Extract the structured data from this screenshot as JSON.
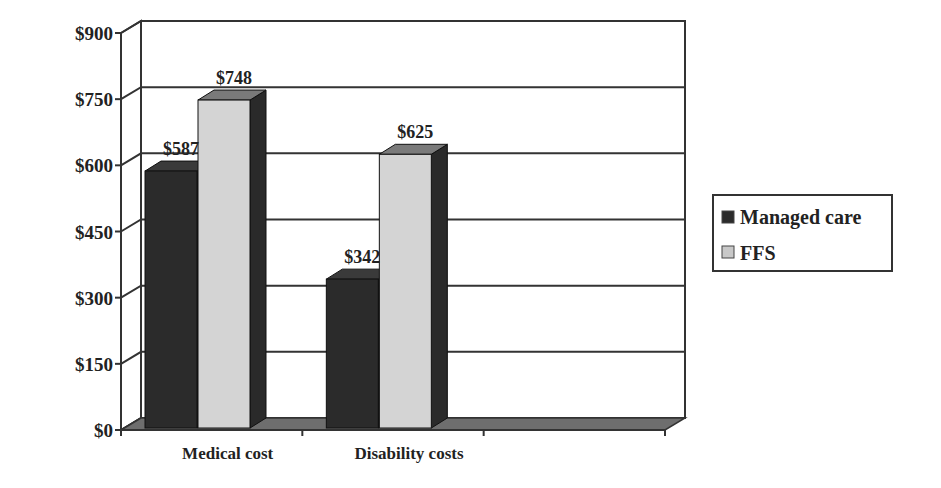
{
  "chart_data": {
    "type": "bar",
    "style": "3d-clustered-column",
    "title": "",
    "xlabel": "",
    "ylabel": "",
    "categories": [
      "Medical cost",
      "Disability costs"
    ],
    "series": [
      {
        "name": "Managed care",
        "values": [
          587,
          342
        ],
        "labels": [
          "$587",
          "$342"
        ],
        "color": "#2b2b2b"
      },
      {
        "name": "FFS",
        "values": [
          748,
          625
        ],
        "labels": [
          "$748",
          "$625"
        ],
        "color": "#d4d4d4"
      }
    ],
    "ylim": [
      0,
      900
    ],
    "yticks": [
      0,
      150,
      300,
      450,
      600,
      750,
      900
    ],
    "ytick_labels": [
      "$0",
      "$150",
      "$300",
      "$450",
      "$600",
      "$750",
      "$900"
    ],
    "grid": true,
    "legend_position": "right",
    "empty_category_slots": 1
  },
  "legend": {
    "items": [
      {
        "label": "Managed care",
        "color": "#2b2b2b"
      },
      {
        "label": "FFS",
        "color": "#c8c8c8"
      }
    ]
  },
  "colors": {
    "axis": "#333333",
    "floor": "#6e6e6e",
    "managed_front": "#2b2b2b",
    "managed_side": "#1c1c1c",
    "managed_top": "#3a3a3a",
    "ffs_front": "#d4d4d4",
    "ffs_side": "#2a2a2a",
    "ffs_top": "#7a7a7a"
  }
}
